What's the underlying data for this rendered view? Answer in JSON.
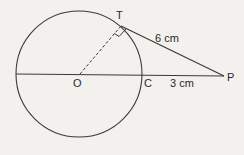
{
  "diagram": {
    "type": "geometry",
    "points": {
      "O": {
        "label": "O"
      },
      "T": {
        "label": "T"
      },
      "C": {
        "label": "C"
      },
      "P": {
        "label": "P"
      }
    },
    "measurements": {
      "TP": "6 cm",
      "CP": "3 cm"
    },
    "colors": {
      "line": "#3a3a3a",
      "background": "#f2f1ee"
    }
  }
}
